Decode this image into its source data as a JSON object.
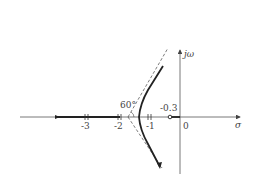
{
  "diagram": {
    "type": "root-locus",
    "axes": {
      "real_label": "σ",
      "imag_label": "jω",
      "origin_label": "0"
    },
    "ticks": [
      "-3",
      "-2",
      "-1"
    ],
    "zero_label": "-0.3",
    "angle_label": "60°",
    "colors": {
      "axis": "#555555",
      "locus": "#222222",
      "asymptote": "#444444"
    }
  }
}
